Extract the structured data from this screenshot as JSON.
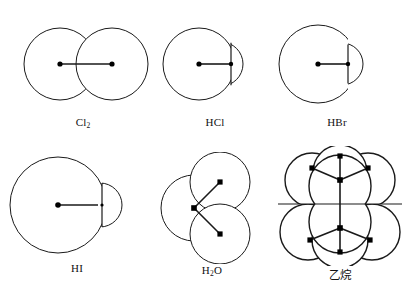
{
  "figure": {
    "title": "",
    "background_color": "#ffffff",
    "stroke_color": "#1a1a1a",
    "nucleus_color": "#000000",
    "rows": 2,
    "columns": 3,
    "width": 409,
    "height": 299
  },
  "molecules": [
    {
      "id": "cl2",
      "label": "Cl",
      "label_sub": "2",
      "label_plain": "Cl2",
      "name": "chlorine-molecule",
      "type": "diatomic-homonuclear",
      "atoms": [
        {
          "element": "Cl",
          "cx": 52,
          "cy": 60,
          "r": 36
        },
        {
          "element": "Cl",
          "cx": 104,
          "cy": 60,
          "r": 36
        }
      ],
      "bonds": [
        {
          "from": 0,
          "to": 1,
          "length_px": 52
        }
      ]
    },
    {
      "id": "hcl",
      "label": "HCl",
      "label_sub": "",
      "label_plain": "HCl",
      "name": "hydrogen-chloride-molecule",
      "type": "diatomic-heteronuclear",
      "atoms": [
        {
          "element": "Cl",
          "cx": 44,
          "cy": 60,
          "r": 36
        },
        {
          "element": "H",
          "cx": 78,
          "cy": 60,
          "r": 22
        }
      ],
      "bonds": [
        {
          "from": 0,
          "to": 1,
          "length_px": 34
        }
      ]
    },
    {
      "id": "hbr",
      "label": "HBr",
      "label_sub": "",
      "label_plain": "HBr",
      "name": "hydrogen-bromide-molecule",
      "type": "diatomic-heteronuclear",
      "atoms": [
        {
          "element": "Br",
          "cx": 44,
          "cy": 60,
          "r": 39
        },
        {
          "element": "H",
          "cx": 84,
          "cy": 60,
          "r": 21
        }
      ],
      "bonds": [
        {
          "from": 0,
          "to": 1,
          "length_px": 40
        }
      ]
    },
    {
      "id": "hi",
      "label": "HI",
      "label_sub": "",
      "label_plain": "HI",
      "name": "hydrogen-iodide-molecule",
      "type": "diatomic-heteronuclear",
      "atoms": [
        {
          "element": "I",
          "cx": 54,
          "cy": 57,
          "r": 48
        },
        {
          "element": "H",
          "cx": 101,
          "cy": 57,
          "r": 20
        }
      ],
      "bonds": [
        {
          "from": 0,
          "to": 1,
          "length_px": 47
        }
      ]
    },
    {
      "id": "h2o",
      "label": "H",
      "label_sub": "2",
      "label_suffix": "O",
      "label_plain": "H2O",
      "name": "water-molecule",
      "type": "bent-triatomic",
      "bond_angle_deg": 105,
      "atoms": [
        {
          "element": "O",
          "cx": 47,
          "cy": 58,
          "r": 33
        },
        {
          "element": "H",
          "cx": 68,
          "cy": 33,
          "r": 30
        },
        {
          "element": "H",
          "cx": 68,
          "cy": 83,
          "r": 30
        }
      ],
      "bonds": [
        {
          "from": 0,
          "to": 1,
          "length_px": 33
        },
        {
          "from": 0,
          "to": 2,
          "length_px": 33
        }
      ]
    },
    {
      "id": "ethane",
      "label": "乙烷",
      "label_sub": "",
      "label_plain": "乙烷",
      "name": "ethane-molecule",
      "type": "tetrahedral-pair",
      "atoms": [
        {
          "element": "C",
          "cx": 70,
          "cy": 44,
          "r": 31
        },
        {
          "element": "C",
          "cx": 70,
          "cy": 80,
          "r": 31
        },
        {
          "element": "H",
          "cx": 40,
          "cy": 30,
          "r": 27
        },
        {
          "element": "H",
          "cx": 100,
          "cy": 30,
          "r": 27
        },
        {
          "element": "H",
          "cx": 70,
          "cy": 18,
          "r": 27
        },
        {
          "element": "H",
          "cx": 38,
          "cy": 92,
          "r": 28
        },
        {
          "element": "H",
          "cx": 102,
          "cy": 92,
          "r": 28
        },
        {
          "element": "H",
          "cx": 70,
          "cy": 104,
          "r": 28
        }
      ],
      "bonds": [
        {
          "from": 0,
          "to": 1,
          "length_px": 36
        },
        {
          "from": 0,
          "to": 2,
          "length_px": 33
        },
        {
          "from": 0,
          "to": 3,
          "length_px": 33
        },
        {
          "from": 0,
          "to": 4,
          "length_px": 26
        },
        {
          "from": 1,
          "to": 5,
          "length_px": 34
        },
        {
          "from": 1,
          "to": 6,
          "length_px": 34
        },
        {
          "from": 1,
          "to": 7,
          "length_px": 24
        }
      ]
    }
  ]
}
